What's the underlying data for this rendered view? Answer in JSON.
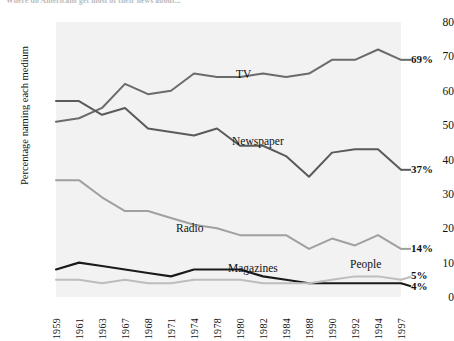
{
  "figure": {
    "title_clipped": "Where do Americans get most of their news about..."
  },
  "chart_data": {
    "type": "line",
    "title": "",
    "xlabel": "",
    "ylabel": "Percentage naming each medium",
    "ylim": [
      0,
      80
    ],
    "yticks": [
      0,
      10,
      20,
      30,
      40,
      50,
      60,
      70,
      80
    ],
    "grid": false,
    "legend_position": "inline-labels",
    "categories": [
      "1959",
      "1961",
      "1963",
      "1967",
      "1968",
      "1971",
      "1974",
      "1978",
      "1980",
      "1982",
      "1984",
      "1988",
      "1990",
      "1992",
      "1994",
      "1997"
    ],
    "series": [
      {
        "name": "TV",
        "color": "#6b6b6b",
        "end_value_label": "69%",
        "label_x": 236,
        "label_y": 68,
        "values": [
          51,
          52,
          55,
          62,
          59,
          60,
          65,
          64,
          64,
          65,
          64,
          65,
          69,
          69,
          72,
          69
        ]
      },
      {
        "name": "Newspaper",
        "color": "#5a5a5a",
        "end_value_label": "37%",
        "label_x": 232,
        "label_y": 135,
        "values": [
          57,
          57,
          53,
          55,
          49,
          48,
          47,
          49,
          44,
          44,
          41,
          35,
          42,
          43,
          43,
          37
        ]
      },
      {
        "name": "Radio",
        "color": "#a0a0a0",
        "end_value_label": "14%",
        "label_x": 176,
        "label_y": 222,
        "values": [
          34,
          34,
          29,
          25,
          25,
          23,
          21,
          20,
          18,
          18,
          18,
          14,
          17,
          15,
          18,
          14
        ]
      },
      {
        "name": "Magazines",
        "color": "#1a1a1a",
        "end_value_label": "4%",
        "label_x": 228,
        "label_y": 262,
        "values": [
          8,
          10,
          9,
          8,
          7,
          6,
          8,
          8,
          8,
          6,
          5,
          4,
          4,
          4,
          4,
          4
        ]
      },
      {
        "name": "People",
        "color": "#bdbdbd",
        "end_value_label": "5%",
        "label_x": 350,
        "label_y": 258,
        "values": [
          5,
          5,
          4,
          5,
          4,
          4,
          5,
          5,
          5,
          4,
          4,
          4,
          5,
          6,
          6,
          5
        ]
      }
    ]
  }
}
